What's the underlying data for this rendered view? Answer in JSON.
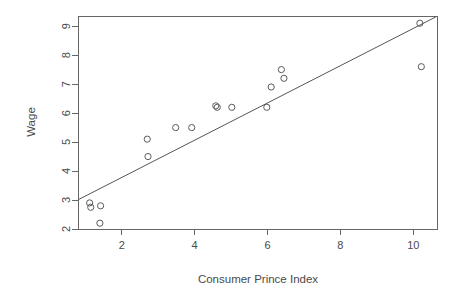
{
  "chart_data": {
    "type": "scatter",
    "title": "",
    "xlabel": "Consumer Prince Index",
    "ylabel": "Wage",
    "xlim": [
      0.8,
      10.65
    ],
    "ylim": [
      2.0,
      9.35
    ],
    "xticks": [
      2,
      4,
      6,
      8,
      10
    ],
    "yticks": [
      2,
      3,
      4,
      5,
      6,
      7,
      8,
      9
    ],
    "xtick_labels": [
      "2",
      "4",
      "6",
      "8",
      "10"
    ],
    "ytick_labels": [
      "2",
      "3",
      "4",
      "5",
      "6",
      "7",
      "8",
      "9"
    ],
    "grid": false,
    "legend": null,
    "marker": "open-circle",
    "point_color": "#5a5a5a",
    "line_color": "#555555",
    "x": [
      1.12,
      1.15,
      1.42,
      1.4,
      2.7,
      2.72,
      3.48,
      3.92,
      4.58,
      4.62,
      5.02,
      5.98,
      6.1,
      6.38,
      6.45,
      10.18,
      10.22
    ],
    "y": [
      2.9,
      2.75,
      2.8,
      2.2,
      5.1,
      4.5,
      5.5,
      5.5,
      6.25,
      6.2,
      6.2,
      6.2,
      6.9,
      7.5,
      7.2,
      9.1,
      7.6
    ],
    "points": [
      {
        "x": 1.12,
        "y": 2.9
      },
      {
        "x": 1.15,
        "y": 2.75
      },
      {
        "x": 1.42,
        "y": 2.8
      },
      {
        "x": 1.4,
        "y": 2.2
      },
      {
        "x": 2.7,
        "y": 5.1
      },
      {
        "x": 2.72,
        "y": 4.5
      },
      {
        "x": 3.48,
        "y": 5.5
      },
      {
        "x": 3.92,
        "y": 5.5
      },
      {
        "x": 4.58,
        "y": 6.25
      },
      {
        "x": 4.62,
        "y": 6.2
      },
      {
        "x": 5.02,
        "y": 6.2
      },
      {
        "x": 5.98,
        "y": 6.2
      },
      {
        "x": 6.1,
        "y": 6.9
      },
      {
        "x": 6.38,
        "y": 7.5
      },
      {
        "x": 6.45,
        "y": 7.2
      },
      {
        "x": 10.18,
        "y": 9.1
      },
      {
        "x": 10.22,
        "y": 7.6
      }
    ],
    "fit_line": {
      "name": "regression-line",
      "x_start": 0.82,
      "y_start": 3.02,
      "x_end": 10.62,
      "y_end": 9.32,
      "slope": 0.643,
      "intercept": 2.493
    }
  }
}
